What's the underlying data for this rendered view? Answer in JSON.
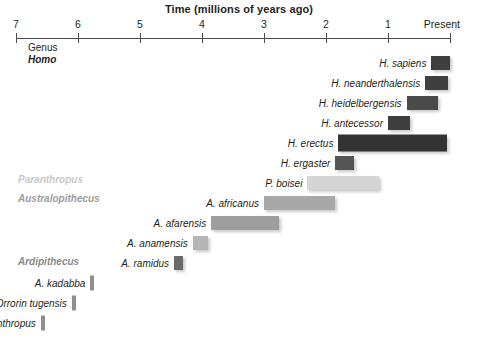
{
  "chart_data": {
    "type": "bar",
    "orientation": "horizontal-range",
    "title": "Time (millions of years ago)",
    "xlabel": "Time (millions of years ago)",
    "ylabel": "",
    "xlim": [
      7,
      0
    ],
    "x_ticks": [
      7,
      6,
      5,
      4,
      3,
      2,
      1
    ],
    "x_tick_labels": [
      "7",
      "6",
      "5",
      "4",
      "3",
      "2",
      "1"
    ],
    "x_axis_end_label": "Present",
    "grid": false,
    "legend": null,
    "axis_direction": "oldest-left-to-present-right",
    "group_labels": [
      {
        "text": "Genus",
        "style": "plain",
        "color": "#231f20"
      },
      {
        "text": "Homo",
        "style": "bold-italic",
        "color": "#231f20"
      },
      {
        "text": "Paranthropus",
        "style": "bold-italic",
        "color": "#c9c9c9"
      },
      {
        "text": "Australopithecus",
        "style": "bold-italic",
        "color": "#9d9d9d"
      },
      {
        "text": "Ardipithecus",
        "style": "bold-italic",
        "color": "#8a8a8a"
      }
    ],
    "series": [
      {
        "name": "H. sapiens",
        "start_mya": 0.3,
        "end_mya": 0.0,
        "color": "#3f3f3f"
      },
      {
        "name": "H. neanderthalensis",
        "start_mya": 0.4,
        "end_mya": 0.03,
        "color": "#3f3f3f"
      },
      {
        "name": "H. heidelbergensis",
        "start_mya": 0.7,
        "end_mya": 0.2,
        "color": "#4a4a4a"
      },
      {
        "name": "H. antecessor",
        "start_mya": 1.0,
        "end_mya": 0.65,
        "color": "#3f3f3f"
      },
      {
        "name": "H. erectus",
        "start_mya": 1.8,
        "end_mya": 0.05,
        "color": "#333333"
      },
      {
        "name": "H. ergaster",
        "start_mya": 1.85,
        "end_mya": 1.55,
        "color": "#555555"
      },
      {
        "name": "P. boisei",
        "start_mya": 2.3,
        "end_mya": 1.15,
        "color": "#d5d5d5"
      },
      {
        "name": "A. africanus",
        "start_mya": 3.0,
        "end_mya": 1.85,
        "color": "#a8a8a8"
      },
      {
        "name": "A. afarensis",
        "start_mya": 3.85,
        "end_mya": 2.75,
        "color": "#9e9e9e"
      },
      {
        "name": "A. anamensis",
        "start_mya": 4.15,
        "end_mya": 3.9,
        "color": "#b5b5b5"
      },
      {
        "name": "A. ramidus",
        "start_mya": 4.45,
        "end_mya": 4.3,
        "color": "#6a6a6a"
      },
      {
        "name": "A. kadabba",
        "start_mya": 5.8,
        "end_mya": 5.75,
        "color": "#8f8f8f"
      },
      {
        "name": "Orrorin tugensis",
        "start_mya": 6.1,
        "end_mya": 6.05,
        "color": "#8f8f8f"
      },
      {
        "name": "Sahelanthropus",
        "start_mya": 6.6,
        "end_mya": 6.55,
        "color": "#8f8f8f"
      }
    ]
  },
  "labels": {
    "genus": "Genus",
    "homo": "Homo",
    "paranthropus": "Paranthropus",
    "australopithecus": "Australopithecus",
    "ardipithecus": "Ardipithecus"
  }
}
